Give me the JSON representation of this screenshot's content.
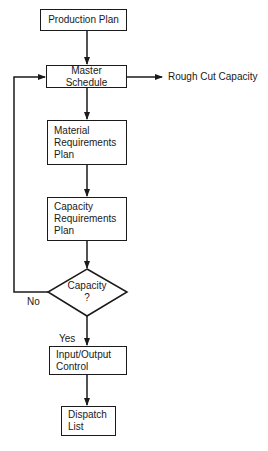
{
  "diagram": {
    "type": "flowchart",
    "nodes": {
      "production_plan": {
        "label": "Production Plan",
        "shape": "rectangle"
      },
      "master_schedule": {
        "label": "Master Schedule",
        "shape": "rectangle"
      },
      "rough_cut": {
        "label": "Rough Cut Capacity",
        "shape": "text"
      },
      "mrp": {
        "lines": [
          "Material",
          "Requirements",
          "Plan"
        ],
        "shape": "rectangle"
      },
      "crp": {
        "lines": [
          "Capacity",
          "Requirements",
          "Plan"
        ],
        "shape": "rectangle"
      },
      "capacity_decision": {
        "lines": [
          "Capacity",
          "?"
        ],
        "shape": "diamond"
      },
      "io_control": {
        "lines": [
          "Input/Output",
          "Control"
        ],
        "shape": "rectangle"
      },
      "dispatch_list": {
        "lines": [
          "Dispatch",
          "List"
        ],
        "shape": "rectangle"
      }
    },
    "edge_labels": {
      "no": "No",
      "yes": "Yes"
    },
    "edges": [
      {
        "from": "Production Plan",
        "to": "Master Schedule"
      },
      {
        "from": "Master Schedule",
        "to": "Rough Cut Capacity"
      },
      {
        "from": "Master Schedule",
        "to": "Material Requirements Plan"
      },
      {
        "from": "Material Requirements Plan",
        "to": "Capacity Requirements Plan"
      },
      {
        "from": "Capacity Requirements Plan",
        "to": "Capacity ?"
      },
      {
        "from": "Capacity ?",
        "to": "Master Schedule",
        "label": "No"
      },
      {
        "from": "Capacity ?",
        "to": "Input/Output Control",
        "label": "Yes"
      },
      {
        "from": "Input/Output Control",
        "to": "Dispatch List"
      }
    ]
  }
}
